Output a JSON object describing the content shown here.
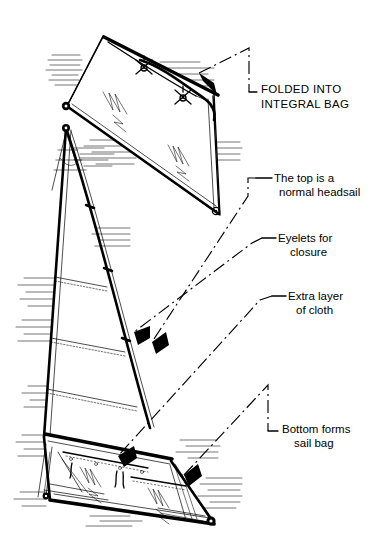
{
  "figure": {
    "style": "black-and-white technical line drawing",
    "background_color": "#ffffff",
    "ink_color": "#000000",
    "width": 379,
    "height": 560
  },
  "callouts": [
    {
      "id": "folded-into-integral-bag",
      "lines": [
        "FOLDED  INTO",
        "INTEGRAL  BAG"
      ],
      "line1": "FOLDED  INTO",
      "line2": "INTEGRAL  BAG",
      "case": "uppercase",
      "leader": "dash-dot with L-bracket and solid arrowhead",
      "points_to": "rolled/folded top edge of the stowed sail"
    },
    {
      "id": "the-top-is-a-normal-headsail",
      "lines": [
        "The top is a",
        "normal  headsail"
      ],
      "line1": "The top is a",
      "line2": "normal  headsail",
      "case": "mixed",
      "leader": "horizontal rule into dash-dot line with arrowhead",
      "points_to": "upper panel of the sail"
    },
    {
      "id": "eyelets-for-closure",
      "lines": [
        "Eyelets  for",
        "closure"
      ],
      "line1": "Eyelets  for",
      "line2": "closure",
      "case": "mixed",
      "leader": "angled rule into dash-dot line with arrowhead",
      "points_to": "row of eyelets along the bag closure"
    },
    {
      "id": "extra-layer-of-cloth",
      "lines": [
        "Extra  layer",
        "of  cloth"
      ],
      "line1": "Extra  layer",
      "line2": "of  cloth",
      "case": "mixed",
      "leader": "angled rule into dash-dot line with arrowhead",
      "points_to": "doubled cloth panel at the foot of the sail"
    },
    {
      "id": "bottom-forms-sail-bag",
      "lines": [
        "Bottom forms",
        "sail    bag"
      ],
      "line1": "Bottom forms",
      "line2": "sail    bag",
      "case": "mixed",
      "leader": "dash-dot with L-bracket and solid arrowhead",
      "points_to": "lower bag section of the sail"
    }
  ],
  "drawing_parts": {
    "folded_bag_panel": "rolled sail shown folded into its bag, upper right of figure",
    "main_sail": "triangular headsail with luff, leech, battens and horizontal seams",
    "bag_section": "reinforced lower panel forming the sail bag",
    "eyelets": "small grommets with lacing ties along closure",
    "corner_patches": "reinforcement patches at head, tack and clew",
    "hatching": "short parallel shading strokes along edges"
  }
}
